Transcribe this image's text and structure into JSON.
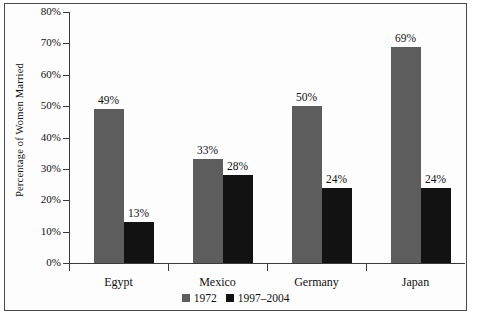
{
  "chart_data": {
    "type": "bar",
    "title": "",
    "xlabel": "",
    "ylabel": "Percentage of Women Married",
    "ylim": [
      0,
      80
    ],
    "ytick_labels": [
      "0%",
      "10%",
      "20%",
      "30%",
      "40%",
      "50%",
      "60%",
      "70%",
      "80%"
    ],
    "ytick_values": [
      0,
      10,
      20,
      30,
      40,
      50,
      60,
      70,
      80
    ],
    "grid": false,
    "legend_position": "bottom-center",
    "categories": [
      "Egypt",
      "Mexico",
      "Germany",
      "Japan"
    ],
    "series": [
      {
        "name": "1972",
        "color": "#5d5d5d",
        "values": [
          49,
          33,
          50,
          69
        ],
        "labels": [
          "49%",
          "33%",
          "50%",
          "69%"
        ]
      },
      {
        "name": "1997–2004",
        "color": "#121212",
        "values": [
          13,
          28,
          24,
          24
        ],
        "labels": [
          "13%",
          "28%",
          "24%",
          "24%"
        ]
      }
    ]
  },
  "legend": {
    "items": [
      {
        "label": "1972",
        "swatch": "legend-swatch-1972"
      },
      {
        "label": "1997–2004",
        "swatch": "legend-swatch-1997-2004"
      }
    ]
  }
}
